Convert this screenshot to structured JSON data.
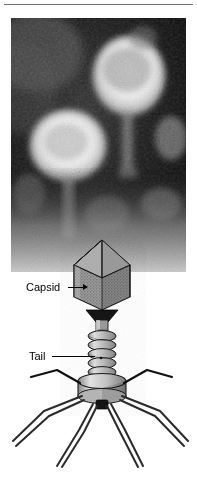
{
  "figure": {
    "panels": [
      {
        "name": "electron-micrograph",
        "kind": "electron-micrograph",
        "description": "Dark-field transmission electron micrograph showing two bright bacteriophage capsids on a dark granular background with faint tails descending below"
      },
      {
        "name": "schematic-diagram",
        "kind": "line-diagram",
        "description": "Labeled line drawing of a tailed bacteriophage (T-even type) with icosahedral capsid, contractile helical tail sheath, baseplate, whiskers and six long tail fibers"
      }
    ]
  },
  "labels": {
    "capsid": "Capsid",
    "tail": "Tail"
  },
  "annotations": [
    {
      "text": "Capsid",
      "pointer": "arrow",
      "target": "capsid-head"
    },
    {
      "text": "Tail",
      "pointer": "line",
      "target": "tail-sheath"
    }
  ],
  "colors": {
    "ink": "#000000",
    "rule": "#6f6f6f",
    "page": "#ffffff",
    "capsid_fill": "#8c8c8c",
    "capsid_top_fill": "#a8a8a8",
    "sheath_fill": "#b4b4b4",
    "baseplate_fill": "#c2c2c2",
    "micrograph_dark": "#0c0c0c",
    "micrograph_bright": "#f2f2f2"
  },
  "geometry": {
    "width": 197,
    "height": 481,
    "micrograph": {
      "x": 11,
      "y": 18,
      "w": 175,
      "h": 254
    },
    "rule": {
      "x": 4,
      "y": 4,
      "w": 189
    },
    "capsid_apex": {
      "x": 102,
      "y": 240
    },
    "tail_fiber_count": 6
  }
}
